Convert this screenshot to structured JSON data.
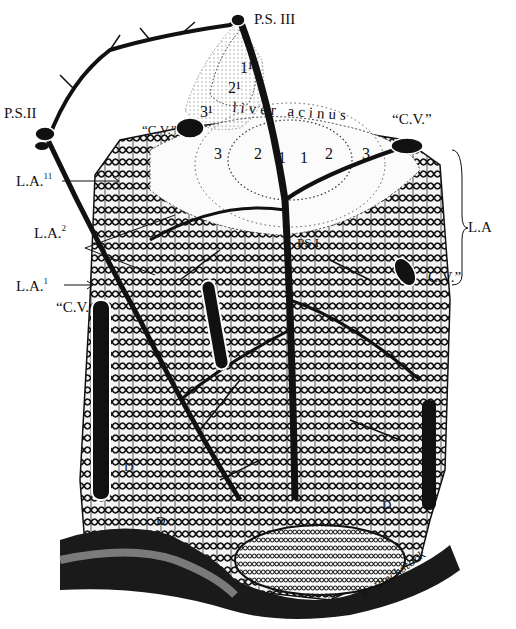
{
  "figure": {
    "labels": {
      "ps3": "P.S. III",
      "ps2": "P.S.II",
      "ps1": "PS I",
      "la_11": {
        "text": "L.A.",
        "sup": "11"
      },
      "la_2": {
        "text": "L.A.",
        "sup": "2"
      },
      "la_1": {
        "text": "L.A.",
        "sup": "1"
      },
      "la_right": "L.A",
      "cv_top_left": "“C.V.”",
      "cv_top_right": "“C.V.”",
      "cv_right": "C.V.”",
      "cv_left": "“C.V.",
      "liver_acinus": "liver acinus",
      "zone_1_prime": "1¹",
      "zone_2_prime": "2¹",
      "zone_3_prime": "3¹",
      "zone_3_left": "3",
      "zone_2_left": "2",
      "zone_1_left": "1",
      "zone_1_right": "1",
      "zone_2_right": "2",
      "zone_3_right": "3",
      "d_left": "D",
      "d_bottom": "D",
      "d_right": "D",
      "signature": "E. Blackstock"
    }
  }
}
